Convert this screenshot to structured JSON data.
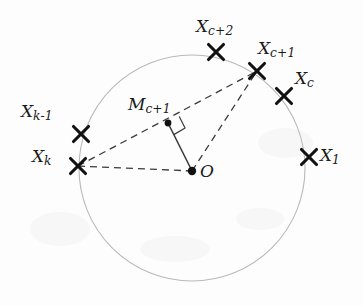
{
  "figure": {
    "background_color": "#fdfdfd",
    "circle": {
      "center_x": 192,
      "center_y": 168,
      "radius": 113,
      "stroke_color": "#b9b9b9",
      "stroke_width": 1.1
    },
    "line_color": "#3a3a3a",
    "marker_color": "#111111",
    "dash_pattern": "7,5"
  },
  "points": [
    {
      "id": "Xc2",
      "label_base": "X",
      "label_sub": "c+2",
      "x": 216,
      "y": 52,
      "label_x": 196,
      "label_y": 18,
      "marker": "cross"
    },
    {
      "id": "Xc1",
      "label_base": "X",
      "label_sub": "c+1",
      "x": 257,
      "y": 71,
      "label_x": 258,
      "label_y": 40,
      "marker": "cross"
    },
    {
      "id": "Xc",
      "label_base": "X",
      "label_sub": "c",
      "x": 284,
      "y": 96,
      "label_x": 295,
      "label_y": 70,
      "marker": "cross"
    },
    {
      "id": "X1",
      "label_base": "X",
      "label_sub": "1",
      "x": 309,
      "y": 157,
      "label_x": 320,
      "label_y": 147,
      "marker": "cross"
    },
    {
      "id": "Xk1",
      "label_base": "X",
      "label_sub": "k-1",
      "x": 81,
      "y": 134,
      "label_x": 21,
      "label_y": 103,
      "marker": "cross"
    },
    {
      "id": "Xk",
      "label_base": "X",
      "label_sub": "k",
      "x": 78,
      "y": 166,
      "label_x": 32,
      "label_y": 148,
      "marker": "cross"
    },
    {
      "id": "Mc1",
      "label_base": "M",
      "label_sub": "c+1",
      "x": 168,
      "y": 123,
      "label_x": 128,
      "label_y": 96,
      "marker": "dot"
    },
    {
      "id": "O",
      "label_base": "O",
      "label_sub": "",
      "x": 192,
      "y": 171,
      "label_x": 200,
      "label_y": 163,
      "marker": "dot"
    }
  ],
  "segments": [
    {
      "id": "seg-Xk-Mc1-Xc1",
      "from": "Xk",
      "to": "Xc1",
      "style": "dashed",
      "note": "passes through M_{c+1}"
    },
    {
      "id": "seg-Xk-O",
      "from": "Xk",
      "to": "O",
      "style": "dashed"
    },
    {
      "id": "seg-O-Xc1",
      "from": "O",
      "to": "Xc1",
      "style": "dashed"
    },
    {
      "id": "seg-Mc1-O",
      "from": "Mc1",
      "to": "O",
      "style": "solid"
    }
  ],
  "right_angle": {
    "id": "right-angle-marker",
    "at": "Mc1",
    "size": 13,
    "note": "square marker showing M_{c+1}O is perpendicular to X_k X_{c+1}"
  }
}
